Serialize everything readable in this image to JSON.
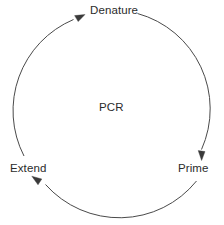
{
  "diagram": {
    "title": "PCR",
    "center_label": "PCR",
    "type": "cycle",
    "direction": "clockwise",
    "stroke_color": "#4a4a4a",
    "text_color": "#2b2b2b",
    "background_color": "#ffffff",
    "nodes": [
      {
        "id": "denature",
        "label": "Denature",
        "position": "top"
      },
      {
        "id": "prime",
        "label": "Prime",
        "position": "bottom-right"
      },
      {
        "id": "extend",
        "label": "Extend",
        "position": "bottom-left"
      }
    ],
    "edges": [
      {
        "from": "extend",
        "to": "denature",
        "arrow": "arrowhead-denature"
      },
      {
        "from": "denature",
        "to": "prime",
        "arrow": "arrowhead-prime"
      },
      {
        "from": "prime",
        "to": "extend",
        "arrow": "arrowhead-extend"
      }
    ]
  }
}
